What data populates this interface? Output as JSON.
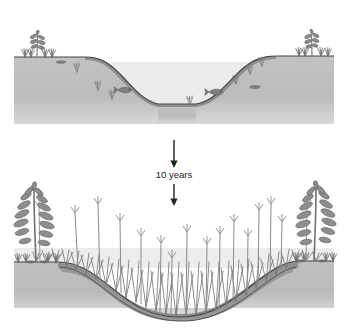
{
  "figure": {
    "background_color": "#ffffff"
  },
  "transition": {
    "label": "10 years",
    "arrow_up_name": "arrow-down-top",
    "arrow_down_name": "arrow-down-bottom",
    "text_color": "#1a1a1a"
  },
  "panels": [
    {
      "id": "panel-before",
      "name": "top-panel-open-pond",
      "caption": "",
      "ground_color": "#b9b9b9",
      "water_color": "#cfcfcf",
      "sediment_color": "#8f8f8f",
      "outline_color": "#3a3a3a",
      "features": {
        "left_shrub": "small-shrub-left",
        "right_shrub": "small-shrub-right",
        "fish_count": 2,
        "submerged_plants": 6,
        "water_surface_y": 62
      }
    },
    {
      "id": "panel-after",
      "name": "bottom-panel-filled-pond",
      "caption": "",
      "ground_color": "#b9b9b9",
      "water_color": "#d6d6d6",
      "sediment_color": "#9a9a9a",
      "outline_color": "#3a3a3a",
      "features": {
        "left_shrub": "large-leafy-shrub-left",
        "right_shrub": "large-leafy-shrub-right",
        "fish_count": 0,
        "cattail_count": 14,
        "reed_clumps": 30,
        "water_surface_y": 262
      }
    }
  ],
  "colors": {
    "soil": "#b9b9b9",
    "soil_light": "#c6c6c6",
    "water": "#d2d2d2",
    "sediment": "#969696",
    "sediment_dark": "#8b8b8b",
    "plant": "#8d8d8d",
    "plant_dark": "#6e6e6e",
    "outline": "#3a3a3a",
    "paper": "#fbfbfb"
  }
}
